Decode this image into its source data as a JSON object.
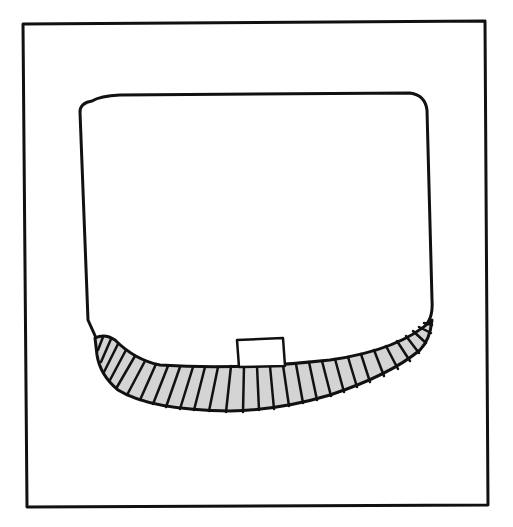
{
  "diagram": {
    "colors": {
      "background": "#ffffff",
      "stroke": "#111111",
      "band_fill": "#d4d4d4",
      "inner_fill": "#ffffff"
    },
    "elements": [
      {
        "id": "outer-frame",
        "shape": "square"
      },
      {
        "id": "container",
        "shape": "rounded-rect-bowl"
      },
      {
        "id": "hatched-band",
        "shape": "crescent",
        "hatch_lines": 30
      },
      {
        "id": "small-box",
        "shape": "rectangle"
      }
    ]
  }
}
